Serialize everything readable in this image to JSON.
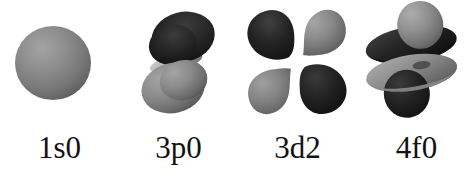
{
  "figure": {
    "background_color": "#ffffff",
    "label_color": "#121212",
    "colors": {
      "lobe_dark_high": "#3a3a3a",
      "lobe_dark_low": "#101010",
      "lobe_light_high": "#a2a2a2",
      "lobe_light_low": "#4b4b4b",
      "sphere_high": "#9a9a9a",
      "sphere_low": "#5e5e5e",
      "seam_light": "#c8c8c8"
    },
    "orbitals": [
      {
        "label": "1s0",
        "icon": "orbital-1s-sphere-icon",
        "shape": "sphere",
        "lobe_count": 1,
        "n": 1,
        "l_letter": "s",
        "m": 0
      },
      {
        "label": "3p0",
        "icon": "orbital-3p-dumbbell-icon",
        "shape": "two-lobe-dumbbell",
        "lobe_count": 2,
        "n": 3,
        "l_letter": "p",
        "m": 0
      },
      {
        "label": "3d2",
        "icon": "orbital-3d-cloverleaf-icon",
        "shape": "four-lobe-cloverleaf",
        "lobe_count": 4,
        "n": 3,
        "l_letter": "d",
        "m": 2
      },
      {
        "label": "4f0",
        "icon": "orbital-4f-stacked-lobes-icon",
        "shape": "two-lobes-with-two-tori",
        "lobe_count": 4,
        "n": 4,
        "l_letter": "f",
        "m": 0
      }
    ]
  }
}
